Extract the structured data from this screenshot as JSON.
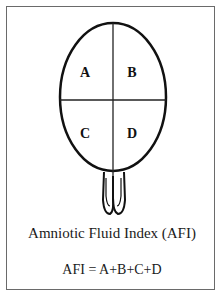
{
  "diagram": {
    "title": "Amniotic Fluid Index (AFI)",
    "formula": "AFI = A+B+C+D",
    "quadrants": [
      {
        "label": "A",
        "position": "upper-left"
      },
      {
        "label": "B",
        "position": "upper-right"
      },
      {
        "label": "C",
        "position": "lower-left"
      },
      {
        "label": "D",
        "position": "lower-right"
      }
    ],
    "colors": {
      "stroke": "#111111",
      "frame": "#6a6a6a",
      "background": "#ffffff"
    }
  }
}
